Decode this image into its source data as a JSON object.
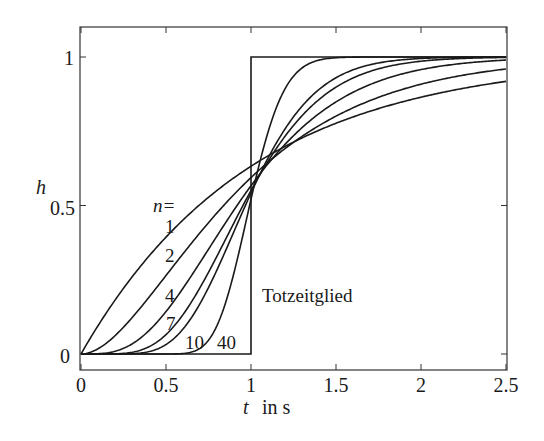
{
  "chart_data": {
    "type": "line",
    "title": "",
    "xlabel": "t  in s",
    "ylabel": "h",
    "xlim": [
      0,
      2.5
    ],
    "ylim": [
      -0.05,
      1.1
    ],
    "xticks": [
      0,
      0.5,
      1,
      1.5,
      2,
      2.5
    ],
    "xtick_labels": [
      "0",
      "0.5",
      "1",
      "1.5",
      "2",
      "2.5"
    ],
    "yticks": [
      0,
      0.5,
      1
    ],
    "ytick_labels": [
      "0",
      "0.5",
      "1"
    ],
    "grid": false,
    "legend": "none (inline labels)",
    "series": [
      {
        "name": "n=1",
        "order": 1,
        "formula": "1 - e^{-t}"
      },
      {
        "name": "n=2",
        "order": 2,
        "formula": "1 - e^{-2t}(1+2t)"
      },
      {
        "name": "n=4",
        "order": 4
      },
      {
        "name": "n=7",
        "order": 7
      },
      {
        "name": "n=10",
        "order": 10
      },
      {
        "name": "n=40",
        "order": 40
      },
      {
        "name": "Totzeitglied",
        "type": "step",
        "delay": 1,
        "x": [
          0,
          1,
          1,
          2.5
        ],
        "values": [
          0,
          0,
          1,
          1
        ]
      }
    ],
    "sample_values": {
      "t": [
        0,
        0.5,
        1,
        1.5,
        2,
        2.5
      ],
      "n1": [
        0,
        0.393,
        0.632,
        0.777,
        0.865,
        0.918
      ],
      "n2": [
        0,
        0.264,
        0.594,
        0.801,
        0.908,
        0.96
      ],
      "n4": [
        0,
        0.143,
        0.567,
        0.849,
        0.958,
        0.99
      ],
      "n7": [
        0,
        0.073,
        0.55,
        0.89,
        0.983,
        0.998
      ],
      "n10": [
        0,
        0.032,
        0.542,
        0.917,
        0.992,
        0.999
      ],
      "n40": [
        0,
        0.0,
        0.521,
        0.993,
        1.0,
        1.0
      ]
    },
    "annotations": [
      {
        "text": "n=",
        "x": 0.5,
        "y": 0.52
      },
      {
        "text": "1",
        "x": 0.53,
        "y": 0.44
      },
      {
        "text": "2",
        "x": 0.53,
        "y": 0.34
      },
      {
        "text": "4",
        "x": 0.52,
        "y": 0.19
      },
      {
        "text": "7",
        "x": 0.53,
        "y": 0.1
      },
      {
        "text": "10",
        "x": 0.72,
        "y": 0.03
      },
      {
        "text": "40",
        "x": 0.88,
        "y": 0.03
      },
      {
        "text": "Totzeitglied",
        "x": 1.08,
        "y": 0.22
      }
    ]
  },
  "labels": {
    "ylabel": "h",
    "xlabel_var": "t",
    "xlabel_unit": "in s",
    "n_eq": "n=",
    "n1": "1",
    "n2": "2",
    "n4": "4",
    "n7": "7",
    "n10": "10",
    "n40": "40",
    "deadtime": "Totzeitglied",
    "xt0": "0",
    "xt1": "0.5",
    "xt2": "1",
    "xt3": "1.5",
    "xt4": "2",
    "xt5": "2.5",
    "yt0": "0",
    "yt1": "0.5",
    "yt2": "1"
  }
}
